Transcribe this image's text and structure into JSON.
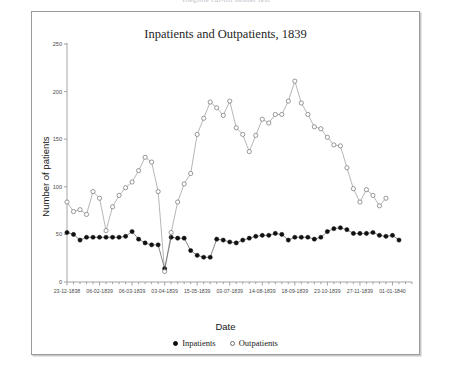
{
  "header": {
    "faint_text": "illegible cut-off header text"
  },
  "figure": {
    "title": "Inpatients and Outpatients, 1839",
    "xlabel": "Date",
    "ylabel": "Number of patients"
  },
  "legend": {
    "position": "bottom-center",
    "entries": [
      {
        "label": "Inpatients",
        "marker": "filled-circle"
      },
      {
        "label": "Outpatients",
        "marker": "open-circle"
      }
    ]
  },
  "chart_data": {
    "type": "line",
    "title": "Inpatients and Outpatients, 1839",
    "xlabel": "Date",
    "ylabel": "Number of patients",
    "grid": false,
    "legend_position": "bottom-center",
    "ylim": [
      0,
      250
    ],
    "yticks": [
      0,
      50,
      100,
      150,
      200,
      250
    ],
    "xlim": [
      0,
      53
    ],
    "xticks": [
      0,
      5,
      10,
      15,
      20,
      25,
      30,
      35,
      40,
      45,
      50
    ],
    "xticklabels": [
      "23-12-1838",
      "06-02-1839",
      "06-03-1839",
      "03-04-1839",
      "15-05-1839",
      "03-07-1839",
      "14-08-1839",
      "18-09-1839",
      "23-10-1839",
      "27-11-1839",
      "01-01-1840"
    ],
    "series": [
      {
        "name": "Inpatients",
        "marker": "filled-circle",
        "color": "#101010",
        "x": [
          0,
          1,
          2,
          3,
          4,
          5,
          6,
          7,
          8,
          9,
          10,
          11,
          12,
          13,
          14,
          15,
          16,
          17,
          18,
          19,
          20,
          21,
          22,
          23,
          24,
          25,
          26,
          27,
          28,
          29,
          30,
          31,
          32,
          33,
          34,
          35,
          36,
          37,
          38,
          39,
          40,
          41,
          42,
          43,
          44,
          45,
          46,
          47,
          48,
          49,
          50,
          51
        ],
        "values": [
          52,
          50,
          44,
          47,
          47,
          47,
          47,
          47,
          47,
          48,
          53,
          45,
          41,
          39,
          39,
          14,
          47,
          46,
          46,
          33,
          28,
          26,
          26,
          45,
          44,
          42,
          41,
          44,
          46,
          48,
          49,
          49,
          51,
          50,
          44,
          47,
          47,
          47,
          45,
          47,
          53,
          56,
          57,
          55,
          51,
          51,
          51,
          52,
          49,
          48,
          49,
          44
        ]
      },
      {
        "name": "Outpatients",
        "marker": "open-circle",
        "color": "#6f6f6f",
        "x": [
          0,
          1,
          2,
          3,
          4,
          5,
          6,
          7,
          8,
          9,
          10,
          11,
          12,
          13,
          14,
          15,
          16,
          17,
          18,
          19,
          20,
          21,
          22,
          23,
          24,
          25,
          26,
          27,
          28,
          29,
          30,
          31,
          32,
          33,
          34,
          35,
          36,
          37,
          38,
          39,
          40,
          41,
          42,
          43,
          44,
          45,
          46,
          47,
          48,
          49
        ],
        "values": [
          84,
          74,
          76,
          71,
          95,
          88,
          54,
          79,
          91,
          99,
          105,
          117,
          131,
          126,
          95,
          11,
          52,
          84,
          103,
          114,
          155,
          172,
          189,
          183,
          175,
          190,
          162,
          155,
          137,
          154,
          171,
          167,
          176,
          176,
          190,
          211,
          188,
          176,
          163,
          161,
          152,
          144,
          143,
          120,
          98,
          84,
          97,
          91,
          80,
          88
        ]
      }
    ]
  }
}
